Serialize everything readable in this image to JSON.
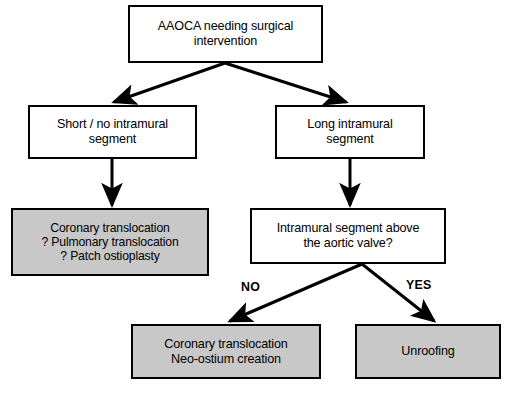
{
  "figure": {
    "type": "flowchart",
    "orientation": "top-down",
    "background_color": "#ffffff",
    "line_color": "#000000",
    "shaded_fill_color": "#c8c8c8",
    "unshaded_fill_color": "#ffffff"
  },
  "nodes": {
    "root": {
      "text": "AAOCA needing surgical\nintervention",
      "shaded": false
    },
    "short_segment": {
      "text": "Short / no intramural\nsegment",
      "shaded": false
    },
    "long_segment": {
      "text": "Long intramural\nsegment",
      "shaded": false
    },
    "translocation_options": {
      "text": "Coronary translocation\n? Pulmonary translocation\n? Patch ostioplasty",
      "shaded": true
    },
    "decision": {
      "text": "Intramural segment above\nthe aortic valve?",
      "shaded": false
    },
    "neo_ostium": {
      "text": "Coronary translocation\nNeo-ostium creation",
      "shaded": true
    },
    "unroofing": {
      "text": "Unroofing",
      "shaded": true
    }
  },
  "edge_labels": {
    "no": "NO",
    "yes": "YES"
  },
  "bleed_through": {
    "band_a": "",
    "band_b": "",
    "caption": ""
  }
}
